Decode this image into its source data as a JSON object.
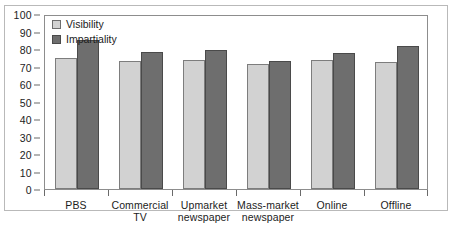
{
  "chart_data": {
    "type": "bar",
    "title": "",
    "subtitle": "",
    "xlabel": "",
    "ylabel": "",
    "ylim": [
      0,
      100
    ],
    "ytick_step": 10,
    "yticks": [
      0,
      10,
      20,
      30,
      40,
      50,
      60,
      70,
      80,
      90,
      100
    ],
    "grid": false,
    "legend_position": "top-left inside plot",
    "categories": [
      "PBS",
      "Commercial\nTV",
      "Upmarket\nnewspaper",
      "Mass-market\nnewspaper",
      "Online",
      "Offline"
    ],
    "series": [
      {
        "name": "Visibility",
        "color": "#d2d2d2",
        "values": [
          75,
          73,
          73.5,
          71.5,
          73.5,
          72.5
        ]
      },
      {
        "name": "Impartiality",
        "color": "#6e6e6e",
        "values": [
          85,
          78.5,
          79.5,
          73,
          77.5,
          82
        ]
      }
    ]
  },
  "legend": {
    "entries": [
      {
        "label": "Visibility"
      },
      {
        "label": "Impartiality"
      }
    ]
  }
}
